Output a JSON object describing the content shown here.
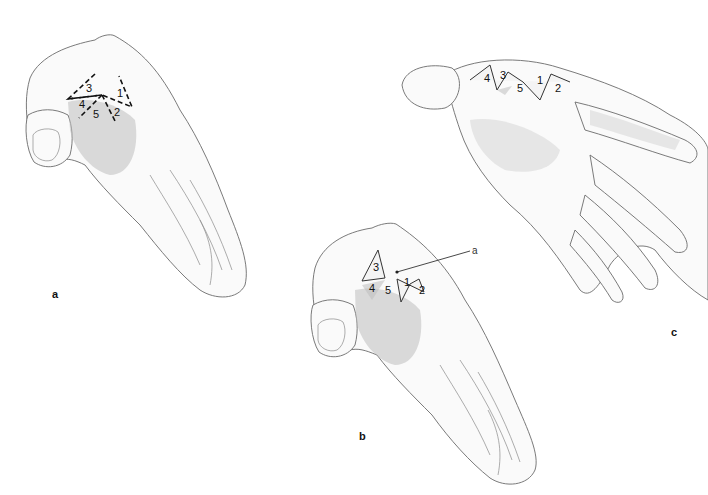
{
  "figure": {
    "panels": [
      {
        "id": "a",
        "label": "a",
        "description": "Hand with dashed incision lines at first web space",
        "flap_labels": [
          "1",
          "2",
          "3",
          "4",
          "5"
        ]
      },
      {
        "id": "b",
        "label": "b",
        "description": "Flaps raised; pointer line",
        "pointer_label": "a",
        "flap_labels": [
          "1",
          "2",
          "3",
          "4",
          "5"
        ]
      },
      {
        "id": "c",
        "label": "c",
        "description": "Flaps transposed and sutured, palm view",
        "flap_labels": [
          "1",
          "2",
          "3",
          "4",
          "5"
        ]
      }
    ]
  }
}
